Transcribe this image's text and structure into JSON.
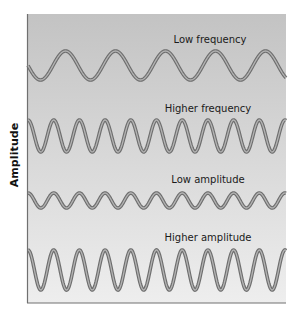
{
  "figure": {
    "y_axis_label": "Amplitude",
    "background_top": "#c3c3c3",
    "background_bottom": "#eeeeee",
    "wave_outer_color": "#6e6e6e",
    "wave_inner_color": "#b4b4b4",
    "axis_color": "#707070",
    "panel": {
      "left": 27,
      "top": 14,
      "right": 286,
      "bottom": 303
    },
    "waves": [
      {
        "id": "low-frequency",
        "label": "Higher frequency_placeholder_unused",
        "title": "Low frequency",
        "label_x": 210,
        "label_y": 39,
        "center_y": 65.5,
        "amplitude": 14.5,
        "period": 50,
        "phase": 0.25,
        "x_start": 28,
        "x_end": 286
      },
      {
        "id": "higher-frequency",
        "title": "Higher frequency",
        "label_x": 208,
        "label_y": 108,
        "center_y": 136,
        "amplitude": 16,
        "period": 25.7,
        "phase": 0.0,
        "x_start": 28,
        "x_end": 286
      },
      {
        "id": "low-amplitude",
        "title": "Low amplitude",
        "label_x": 208,
        "label_y": 179,
        "center_y": 200.5,
        "amplitude": 7.5,
        "period": 25.7,
        "phase": 0.0,
        "x_start": 28,
        "x_end": 286
      },
      {
        "id": "higher-amplitude",
        "title": "Higher amplitude",
        "label_x": 208,
        "label_y": 237,
        "center_y": 270,
        "amplitude": 20,
        "period": 25.7,
        "phase": 0.0,
        "x_start": 28,
        "x_end": 286
      }
    ]
  }
}
